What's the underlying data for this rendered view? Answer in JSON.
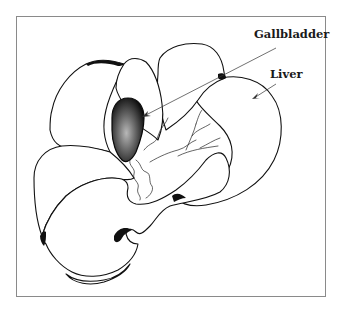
{
  "figure": {
    "labels": {
      "gallbladder": "Gallbladder",
      "liver": "Liver"
    },
    "colors": {
      "line": "#111111",
      "frame": "#8a8a8a",
      "background": "#ffffff",
      "gallbladder_fill": "#2a2a2a"
    }
  }
}
